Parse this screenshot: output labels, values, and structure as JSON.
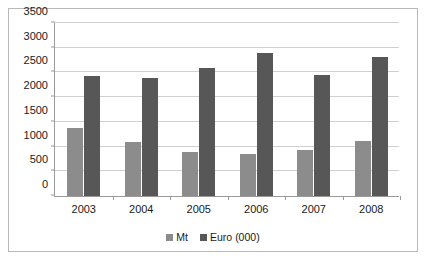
{
  "chart_data": {
    "type": "bar",
    "title": "",
    "subtitle": "",
    "xlabel": "",
    "ylabel": "",
    "categories": [
      "2003",
      "2004",
      "2005",
      "2006",
      "2007",
      "2008"
    ],
    "series": [
      {
        "name": "Mt",
        "color": "#8c8c8c",
        "values": [
          1370,
          1100,
          885,
          840,
          940,
          1110
        ]
      },
      {
        "name": "Euro (000)",
        "color": "#575757",
        "values": [
          2420,
          2380,
          2600,
          2890,
          2440,
          2820
        ]
      }
    ],
    "ylim": [
      0,
      3500
    ],
    "ytick_step": 500,
    "yticks": [
      0,
      500,
      1000,
      1500,
      2000,
      2500,
      3000,
      3500
    ],
    "ytick_labels": [
      "0",
      "500",
      "1000",
      "1500",
      "2000",
      "2500",
      "3000",
      "3500"
    ],
    "grid": true,
    "grid_axis": "y",
    "legend_position": "bottom",
    "plot_background": "#ffffff",
    "grid_color": "#d0d0d0",
    "axis_color": "#9a9a9a",
    "border_color": "#b9b9b9"
  }
}
